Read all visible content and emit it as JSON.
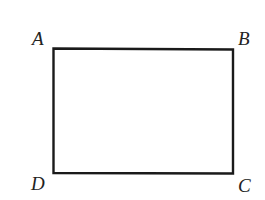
{
  "figure": {
    "type": "rectangle",
    "stroke_color": "#1a1a1a",
    "vertices": [
      {
        "label": "A",
        "x": 53,
        "y": 48
      },
      {
        "label": "B",
        "x": 233,
        "y": 49
      },
      {
        "label": "C",
        "x": 233,
        "y": 174
      },
      {
        "label": "D",
        "x": 53,
        "y": 173
      }
    ],
    "labels": {
      "A": "A",
      "B": "B",
      "C": "C",
      "D": "D"
    }
  }
}
